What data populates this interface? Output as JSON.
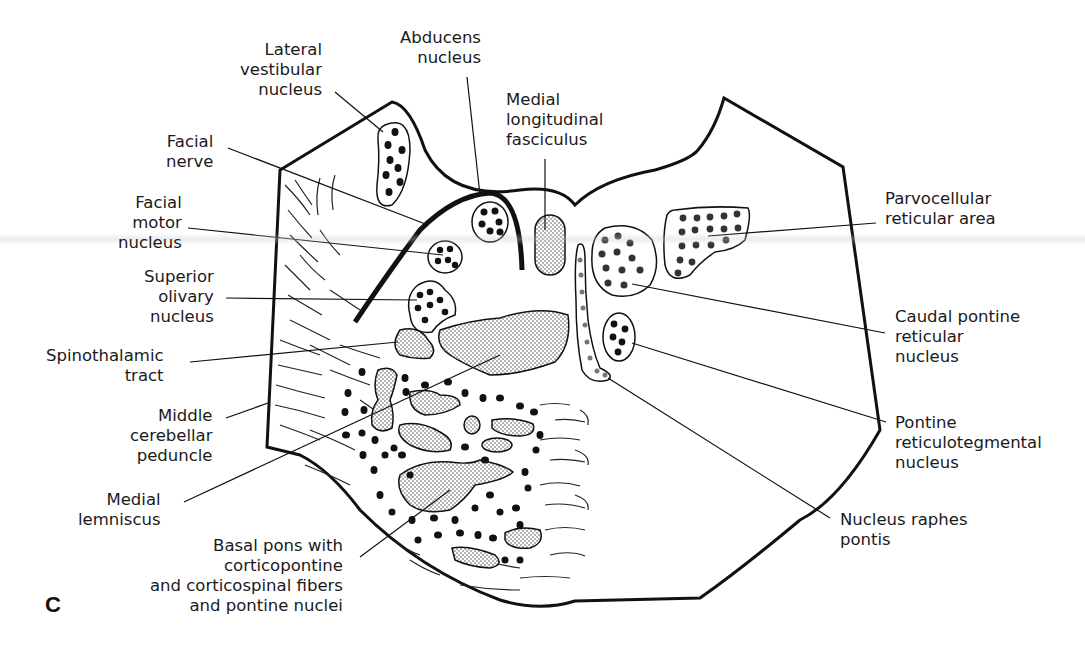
{
  "figure": {
    "panel_letter": "C",
    "caption_fragment": "",
    "labels": {
      "lateral_vestibular_nucleus": [
        "Lateral",
        "vestibular",
        "nucleus"
      ],
      "abducens_nucleus": [
        "Abducens",
        "nucleus"
      ],
      "medial_longitudinal_fasciculus": [
        "Medial",
        "longitudinal",
        "fasciculus"
      ],
      "facial_nerve": [
        "Facial",
        "nerve"
      ],
      "facial_motor_nucleus": [
        "Facial",
        "motor",
        "nucleus"
      ],
      "superior_olivary_nucleus": [
        "Superior",
        "olivary",
        "nucleus"
      ],
      "spinothalamic_tract": [
        "Spinothalamic",
        "tract"
      ],
      "middle_cerebellar_peduncle": [
        "Middle",
        "cerebellar",
        "peduncle"
      ],
      "medial_lemniscus": [
        "Medial",
        "lemniscus"
      ],
      "basal_pons": [
        "Basal pons with",
        "corticopontine",
        "and corticospinal fibers",
        "and pontine nuclei"
      ],
      "parvocellular_reticular_area": [
        "Parvocellular",
        "reticular area"
      ],
      "caudal_pontine_reticular_nucleus": [
        "Caudal pontine",
        "reticular",
        "nucleus"
      ],
      "pontine_reticulotegmental_nucleus": [
        "Pontine",
        "reticulotegmental",
        "nucleus"
      ],
      "nucleus_raphes_pontis": [
        "Nucleus raphes",
        "pontis"
      ]
    },
    "colors": {
      "ink": "#111111",
      "stipple": "#555555",
      "background": "#ffffff"
    }
  }
}
